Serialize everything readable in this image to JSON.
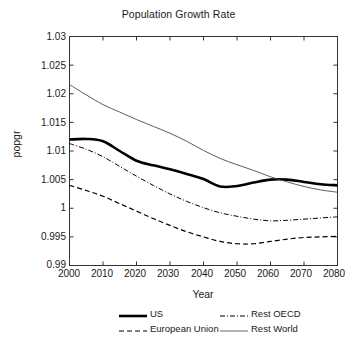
{
  "chart_data": {
    "type": "line",
    "title": "Population Growth Rate",
    "xlabel": "Year",
    "ylabel": "popgr",
    "xlim": [
      2000,
      2080
    ],
    "ylim": [
      0.99,
      1.03
    ],
    "grid": false,
    "legend_position": "below-axes",
    "xticks": [
      "2000",
      "2010",
      "2020",
      "2030",
      "2040",
      "2050",
      "2060",
      "2070",
      "2080"
    ],
    "yticks": [
      "1.03",
      "1.025",
      "1.02",
      "1.015",
      "1.01",
      "1.005",
      "1",
      "0.995",
      "0.99"
    ],
    "x": [
      2000,
      2005,
      2010,
      2015,
      2020,
      2025,
      2030,
      2035,
      2040,
      2045,
      2050,
      2055,
      2060,
      2065,
      2070,
      2075,
      2080
    ],
    "series": [
      {
        "name": "US",
        "style": "solid-thick",
        "color": "#000000",
        "values": [
          1.012,
          1.0121,
          1.0117,
          1.01,
          1.0083,
          1.0075,
          1.0068,
          1.006,
          1.0051,
          1.0038,
          1.0039,
          1.0045,
          1.005,
          1.005,
          1.0046,
          1.0042,
          1.004
        ]
      },
      {
        "name": "European Union",
        "style": "dashed",
        "color": "#000000",
        "values": [
          1.004,
          1.0031,
          1.0021,
          1.0008,
          0.9995,
          0.9982,
          0.997,
          0.9959,
          0.995,
          0.9942,
          0.9938,
          0.9938,
          0.9942,
          0.9946,
          0.9949,
          0.995,
          0.9951
        ]
      },
      {
        "name": "Rest OECD",
        "style": "dash-dot",
        "color": "#000000",
        "values": [
          1.0113,
          1.0103,
          1.009,
          1.0073,
          1.0056,
          1.004,
          1.0025,
          1.0012,
          1.0001,
          0.9992,
          0.9986,
          0.9981,
          0.9978,
          0.9979,
          0.9981,
          0.9983,
          0.9985
        ]
      },
      {
        "name": "Rest World",
        "style": "solid-thin",
        "color": "#000000",
        "values": [
          1.0216,
          1.0198,
          1.0181,
          1.0168,
          1.0155,
          1.0143,
          1.0131,
          1.0117,
          1.0101,
          1.0087,
          1.0076,
          1.0066,
          1.0055,
          1.0046,
          1.0038,
          1.0032,
          1.0028
        ]
      }
    ]
  },
  "legend": {
    "entries": [
      {
        "label": "US",
        "style": "solid-thick"
      },
      {
        "label": "European Union",
        "style": "dashed"
      },
      {
        "label": "Rest OECD",
        "style": "dash-dot"
      },
      {
        "label": "Rest World",
        "style": "solid-thin"
      }
    ]
  }
}
